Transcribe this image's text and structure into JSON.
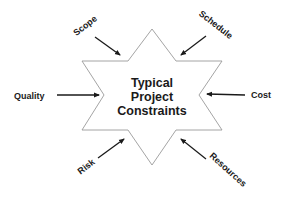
{
  "diagram": {
    "title_lines": [
      "Typical",
      "Project",
      "Constraints"
    ],
    "center_shape": "six-point-star",
    "constraints": [
      {
        "id": "scope",
        "label": "Scope",
        "position": "top-left"
      },
      {
        "id": "schedule",
        "label": "Schedule",
        "position": "top-right"
      },
      {
        "id": "quality",
        "label": "Quality",
        "position": "left"
      },
      {
        "id": "cost",
        "label": "Cost",
        "position": "right"
      },
      {
        "id": "risk",
        "label": "Risk",
        "position": "bottom-left"
      },
      {
        "id": "resources",
        "label": "Resources",
        "position": "bottom-right"
      }
    ],
    "colors": {
      "background": "#ffffff",
      "star_stroke": "#9a9a9a",
      "star_fill": "#ffffff",
      "arrow": "#1a1a1a",
      "text": "#1a1a1a"
    }
  }
}
